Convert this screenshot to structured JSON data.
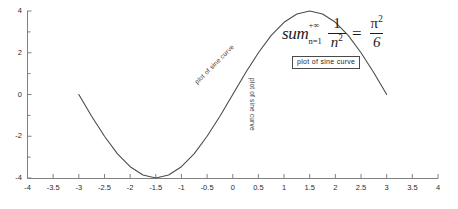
{
  "chart_data": {
    "type": "line",
    "title": "",
    "xlabel": "",
    "ylabel": "",
    "xlim": [
      -4,
      4
    ],
    "ylim": [
      -4,
      4
    ],
    "grid": false,
    "legend": "none",
    "series": [
      {
        "name": "sine curve",
        "expression": "4*sin(pi*x/3)",
        "x": [
          -3,
          -2.75,
          -2.5,
          -2.25,
          -2,
          -1.75,
          -1.5,
          -1.25,
          -1,
          -0.75,
          -0.5,
          -0.25,
          0,
          0.25,
          0.5,
          0.75,
          1,
          1.25,
          1.5,
          1.75,
          2,
          2.25,
          2.5,
          2.75,
          3
        ],
        "values": [
          0,
          -1.04,
          -2,
          -2.83,
          -3.46,
          -3.86,
          -4,
          -3.86,
          -3.46,
          -2.83,
          -2,
          -1.04,
          0,
          1.04,
          2,
          2.83,
          3.46,
          3.86,
          4,
          3.86,
          3.46,
          2.83,
          2,
          1.04,
          0
        ]
      }
    ],
    "x_ticks": [
      {
        "value": -4,
        "label": "-4"
      },
      {
        "value": -3.5,
        "label": "-3.5"
      },
      {
        "value": -3,
        "label": "-3"
      },
      {
        "value": -2.5,
        "label": "-2.5"
      },
      {
        "value": -2,
        "label": "-2"
      },
      {
        "value": -1.5,
        "label": "-1.5"
      },
      {
        "value": -1,
        "label": "-1"
      },
      {
        "value": -0.5,
        "label": "-0.5"
      },
      {
        "value": 0,
        "label": "0"
      },
      {
        "value": 0.5,
        "label": "0.5"
      },
      {
        "value": 1,
        "label": "1"
      },
      {
        "value": 1.5,
        "label": "1.5"
      },
      {
        "value": 2,
        "label": "2"
      },
      {
        "value": 2.5,
        "label": "2.5"
      },
      {
        "value": 3,
        "label": "3"
      },
      {
        "value": 3.5,
        "label": "3.5"
      },
      {
        "value": 4,
        "label": "4"
      }
    ],
    "y_ticks": [
      {
        "value": 4,
        "label": "4",
        "minor": false
      },
      {
        "value": 3,
        "label": "",
        "minor": true
      },
      {
        "value": 2,
        "label": "2",
        "minor": false
      },
      {
        "value": 1,
        "label": "",
        "minor": true
      },
      {
        "value": 0,
        "label": "0",
        "minor": false
      },
      {
        "value": -1,
        "label": "",
        "minor": true
      },
      {
        "value": -2,
        "label": "-2",
        "minor": false
      },
      {
        "value": -3,
        "label": "",
        "minor": true
      },
      {
        "value": -4,
        "label": "-4",
        "minor": false
      }
    ],
    "annotations": [
      {
        "name": "diagonal-curve-label",
        "text": "plot of sine curve",
        "rotation_deg": -45
      },
      {
        "name": "vertical-curve-label",
        "text": "plot of sine curve",
        "rotation_deg": 90
      },
      {
        "name": "boxed-curve-label",
        "text": "plot of sine curve",
        "rotation_deg": 0,
        "boxed": true
      },
      {
        "name": "sum-equation",
        "text": "sum_{n=1}^{+∞} 1/n^2 = π^2/6",
        "rotation_deg": 0
      }
    ],
    "colors": {
      "curve": "#4d4d4d",
      "axis": "#808080",
      "tick_text": "#2b2b2b",
      "annotation_text": "#3a3a3a",
      "equation_text": "#1c1c1c",
      "box_border": "#4a4a4a",
      "background": "#ffffff"
    }
  },
  "equation": {
    "sum_word": "sum",
    "upper_limit": "+∞",
    "lower_limit": "n=1",
    "numerator": "1",
    "denominator_base": "n",
    "denominator_exp": "2",
    "equals": "=",
    "result_num_base": "π",
    "result_num_exp": "2",
    "result_den": "6"
  },
  "labels": {
    "diagonal": "plot of sine curve",
    "vertical": "plot of sine curve",
    "boxed": "plot of sine curve"
  }
}
